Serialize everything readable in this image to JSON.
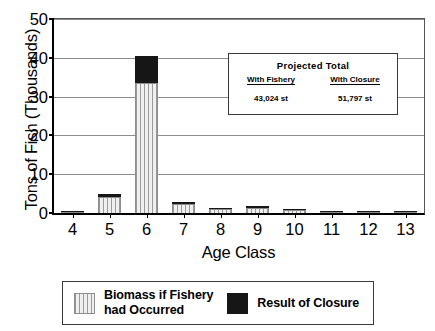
{
  "chart_data": {
    "type": "bar",
    "subtype": "stacked-vertical",
    "title": "",
    "xlabel": "Age Class",
    "ylabel": "Tons of Fish (Thousands)",
    "categories": [
      "4",
      "5",
      "6",
      "7",
      "8",
      "9",
      "10",
      "11",
      "12",
      "13"
    ],
    "series": [
      {
        "name": "Biomass if Fishery had Occurred",
        "pattern": "vertical-hatch",
        "color": "#e8e8e8",
        "values": [
          0.1,
          4.2,
          33.5,
          2.3,
          1.0,
          1.4,
          0.7,
          0.05,
          0.03,
          0.02
        ]
      },
      {
        "name": "Result of Closure",
        "pattern": "solid",
        "color": "#161616",
        "values": [
          0.1,
          0.6,
          7.0,
          0.5,
          0.3,
          0.3,
          0.2,
          0.03,
          0.02,
          0.02
        ]
      }
    ],
    "totals": [
      0.2,
      4.8,
      40.5,
      2.8,
      1.3,
      1.7,
      0.9,
      0.08,
      0.05,
      0.04
    ],
    "ylim": [
      0,
      50
    ],
    "yticks": [
      0,
      10,
      20,
      30,
      40,
      50
    ],
    "grid": true,
    "legend_position": "bottom"
  },
  "axes": {
    "y_title": "Tons of Fish (Thousands)",
    "x_title": "Age Class",
    "y_tick_labels": [
      "0",
      "10",
      "20",
      "30",
      "40",
      "50"
    ],
    "x_tick_labels": [
      "4",
      "5",
      "6",
      "7",
      "8",
      "9",
      "10",
      "11",
      "12",
      "13"
    ]
  },
  "inset": {
    "title": "Projected Total",
    "columns": [
      {
        "header": "With Fishery",
        "value": "43,024 st"
      },
      {
        "header": "With Closure",
        "value": "51,797 st"
      }
    ]
  },
  "legend": {
    "entries": [
      {
        "label": "Biomass if Fishery\nhad Occurred",
        "swatch": "vertical-hatch-swatch"
      },
      {
        "label": "Result of Closure",
        "swatch": "solid-black-swatch"
      }
    ]
  }
}
